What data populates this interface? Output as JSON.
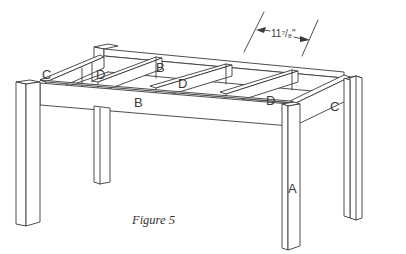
{
  "figure": {
    "caption": "Figure 5"
  },
  "dimension": {
    "label": "11⁷/₈\"",
    "whole": "11",
    "fraction": "7/8",
    "unit": "\""
  },
  "parts": {
    "A": {
      "label": "A",
      "description": "leg"
    },
    "B_front": {
      "label": "B",
      "description": "long apron (front)"
    },
    "B_back": {
      "label": "B",
      "description": "long apron (back)"
    },
    "C_left": {
      "label": "C",
      "description": "short apron (left end)"
    },
    "C_right": {
      "label": "C",
      "description": "short apron (right end)"
    },
    "D1": {
      "label": "D",
      "description": "cross support"
    },
    "D2": {
      "label": "D",
      "description": "cross support"
    },
    "D3": {
      "label": "D",
      "description": "cross support"
    }
  },
  "colors": {
    "line": "#3a3a3a",
    "background": "#ffffff"
  }
}
